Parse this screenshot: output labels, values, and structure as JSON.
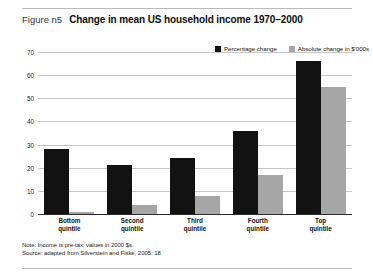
{
  "figure": {
    "number_label": "Figure n5",
    "title": "Change in mean US household income 1970–2000"
  },
  "legend": {
    "items": [
      {
        "label": "Percentage change",
        "color": "#121212",
        "swatch_name": "legend-swatch-percentage-change"
      },
      {
        "label": "Absolute change in $'000s",
        "color": "#a6a6a6",
        "swatch_name": "legend-swatch-absolute-change"
      }
    ]
  },
  "notes": {
    "note": "Note: Income is pre-tax; values in 2000 $s.",
    "source": "Source: adapted from Silverstein and Fiske, 2005: 18"
  },
  "chart_data": {
    "type": "bar",
    "title": "Change in mean US household income 1970–2000",
    "xlabel": "",
    "ylabel": "",
    "ylim": [
      0,
      70
    ],
    "yticks": [
      0,
      10,
      20,
      30,
      40,
      50,
      60,
      70
    ],
    "grid": true,
    "legend_position": "top-right",
    "categories": [
      "Bottom quintile",
      "Second quintile",
      "Third quintile",
      "Fourth quintile",
      "Top quintile"
    ],
    "category_lines": [
      [
        "Bottom",
        "quintile"
      ],
      [
        "Second",
        "quintile"
      ],
      [
        "Third",
        "quintile"
      ],
      [
        "Fourth",
        "quintile"
      ],
      [
        "Top",
        "quintile"
      ]
    ],
    "series": [
      {
        "name": "Percentage change",
        "color": "#121212",
        "values": [
          28,
          21,
          24,
          36,
          66
        ]
      },
      {
        "name": "Absolute change in $'000s",
        "color": "#a6a6a6",
        "values": [
          1,
          4,
          8,
          17,
          55
        ]
      }
    ]
  }
}
